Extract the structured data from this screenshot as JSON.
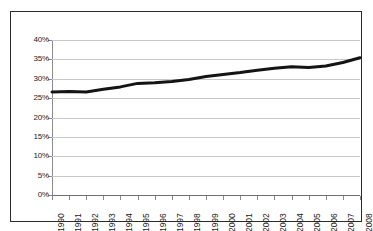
{
  "chart_data": {
    "type": "line",
    "title": "",
    "subtitle": "",
    "xlabel": "",
    "ylabel": "",
    "categories": [
      "1990",
      "1991",
      "1992",
      "1993",
      "1994",
      "1995",
      "1996",
      "1997",
      "1998",
      "1999",
      "2000",
      "2001",
      "2002",
      "2003",
      "2004",
      "2005",
      "2006",
      "2007",
      "2008"
    ],
    "values": [
      26.6,
      26.7,
      26.6,
      27.3,
      27.9,
      28.8,
      29.0,
      29.3,
      29.8,
      30.6,
      31.1,
      31.6,
      32.2,
      32.7,
      33.1,
      32.9,
      33.3,
      34.2,
      35.4
    ],
    "series": [
      {
        "name": "",
        "values": [
          26.6,
          26.7,
          26.6,
          27.3,
          27.9,
          28.8,
          29.0,
          29.3,
          29.8,
          30.6,
          31.1,
          31.6,
          32.2,
          32.7,
          33.1,
          32.9,
          33.3,
          34.2,
          35.4
        ]
      }
    ],
    "ylim": [
      0,
      40
    ],
    "ytick_values": [
      0,
      5,
      10,
      15,
      20,
      25,
      30,
      35,
      40
    ],
    "ytick_labels": [
      "0%",
      "5%",
      "10%",
      "15%",
      "20%",
      "25%",
      "30%",
      "35%",
      "40%"
    ],
    "xtick_labels": [
      "1990",
      "1991",
      "1992",
      "1993",
      "1994",
      "1995",
      "1996",
      "1997",
      "1998",
      "1999",
      "2000",
      "2001",
      "2002",
      "2003",
      "2004",
      "2005",
      "2006",
      "2007",
      "2008"
    ],
    "xtick_rotation": -90,
    "grid": {
      "horizontal": true,
      "vertical": false
    },
    "legend": {
      "visible": false,
      "position": "none",
      "entries": []
    },
    "colors": {
      "line": "#141414",
      "grid": "#c9c9c9",
      "axis": "#8a8a8a",
      "frame": "#2b2b2b",
      "background": "#ffffff",
      "text": "#1a1a1a"
    },
    "line_width_px": 3
  }
}
